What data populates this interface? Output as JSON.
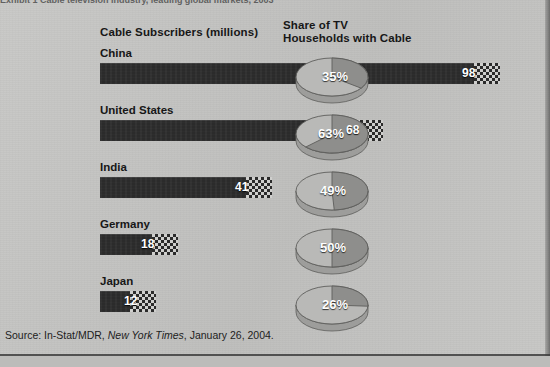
{
  "figure": {
    "top_caption_fragment": "Exhibit 1  Cable television industry, leading global markets, 2003",
    "source_prefix": "Source: In-Stat/MDR,",
    "source_italic": "New York Times",
    "source_suffix": ", January 26, 2004."
  },
  "headers": {
    "bars": "Cable Subscribers (millions)",
    "pies": "Share of TV\nHouseholds with Cable"
  },
  "colors": {
    "paper": "#c6c6c4",
    "bar_fill": "#2b2b2b",
    "bar_label": "#ffffff",
    "pie_light": "#b9b9b7",
    "pie_dark": "#8e8e8c",
    "rule": "#3d3d3d"
  },
  "chart_data": {
    "type": "bar",
    "xlabel": "",
    "ylabel": "",
    "xlim": [
      0,
      98
    ],
    "grid": false,
    "legend": null,
    "categories": [
      "China",
      "United States",
      "India",
      "Germany",
      "Japan"
    ],
    "series": [
      {
        "name": "Cable Subscribers (millions)",
        "units": "millions",
        "values": [
          98,
          68,
          41,
          18,
          12
        ]
      },
      {
        "name": "Share of TV Households with Cable",
        "units": "percent",
        "type": "pie",
        "values": [
          35,
          63,
          49,
          50,
          26
        ]
      }
    ],
    "annotations": [
      "Source: In-Stat/MDR, New York Times, January 26, 2004."
    ]
  },
  "rows": [
    {
      "label": "China",
      "bar_value": "98",
      "bar_width_px": 400,
      "value_offset_px": 362,
      "pie_pct": "35%",
      "pie_value": 35,
      "pie_left_px": 290,
      "pct_left_px": 322,
      "pct_top_px": 22
    },
    {
      "label": "United States",
      "bar_value": "68",
      "bar_width_px": 283,
      "value_offset_px": 246,
      "pie_pct": "63%",
      "pie_value": 63,
      "pie_left_px": 290,
      "pct_left_px": 318,
      "pct_top_px": 22
    },
    {
      "label": "India",
      "bar_value": "41",
      "bar_width_px": 172,
      "value_offset_px": 135,
      "pie_pct": "49%",
      "pie_value": 49,
      "pie_left_px": 290,
      "pct_left_px": 320,
      "pct_top_px": 22
    },
    {
      "label": "Germany",
      "bar_value": "18",
      "bar_width_px": 78,
      "value_offset_px": 41,
      "pie_pct": "50%",
      "pie_value": 50,
      "pie_left_px": 290,
      "pct_left_px": 320,
      "pct_top_px": 22
    },
    {
      "label": "Japan",
      "bar_value": "12",
      "bar_width_px": 56,
      "value_offset_px": 24,
      "pie_pct": "26%",
      "pie_value": 26,
      "pie_left_px": 290,
      "pct_left_px": 322,
      "pct_top_px": 22
    }
  ],
  "row_tops": [
    47,
    104,
    161,
    218,
    275
  ]
}
